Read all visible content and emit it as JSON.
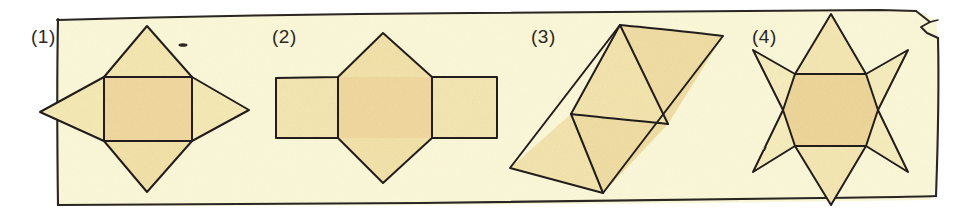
{
  "figure": {
    "caption_style": "scanned textbook line drawing, hand-inked outlines with watercolour wash",
    "paper_color": "#fbf8d8",
    "page_background": "#ffffff",
    "ink_color": "#231f1c",
    "fill_light": "#f7eeb4",
    "fill_mid": "#f3e3a8",
    "fill_deep": "#f0d79a",
    "label_color": "#2b2721",
    "border": {
      "name": "hand-drawn-sheet-border",
      "stroke": "#231f1c",
      "note": "slightly wavy rectangle enclosing the four panels with a small folded corner at top right"
    }
  },
  "panels": [
    {
      "id": "panel-1",
      "label": "(1)",
      "shape_name": "square-with-four-triangles",
      "description": "A central square with an isosceles triangle attached to each of its four sides, forming a four-pointed star / kite outline.",
      "parts": {
        "squares": 1,
        "triangles": 4
      }
    },
    {
      "id": "panel-2",
      "label": "(2)",
      "shape_name": "three-squares-row-with-two-triangles",
      "description": "A horizontal row of three squares with one triangle above and one triangle below the middle square.",
      "parts": {
        "squares": 3,
        "triangles": 2
      }
    },
    {
      "id": "panel-3",
      "label": "(3)",
      "shape_name": "slanted-parallelogram-of-four-triangles",
      "description": "A tilted parallelogram subdivided by internal lines into four congruent triangles.",
      "parts": {
        "squares": 0,
        "triangles": 4
      }
    },
    {
      "id": "panel-4",
      "label": "(4)",
      "shape_name": "six-pointed-star-with-hexagon",
      "description": "A regular hexagon with a triangle on each of its six edges, forming a six-pointed star.",
      "parts": {
        "hexagons": 1,
        "triangles": 6
      }
    }
  ],
  "marks": [
    {
      "name": "ink-speck",
      "note": "tiny stray ink dash near the top-right of panel 1"
    }
  ]
}
